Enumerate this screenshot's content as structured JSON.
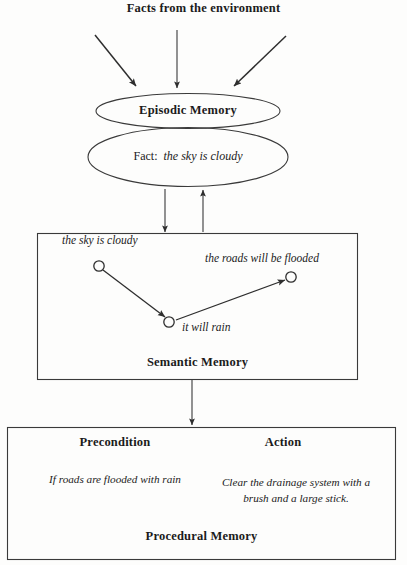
{
  "diagram": {
    "headline": "Facts from the environment",
    "episodic": {
      "title": "Episodic Memory",
      "fact_lead": "Fact:",
      "fact_value": "the sky is cloudy"
    },
    "semantic": {
      "title": "Semantic Memory",
      "nodes": [
        {
          "id": "a",
          "label": "the sky is cloudy"
        },
        {
          "id": "b",
          "label": "it will rain"
        },
        {
          "id": "c",
          "label": "the roads will be flooded"
        }
      ]
    },
    "procedural": {
      "title": "Procedural Memory",
      "precondition_header": "Precondition",
      "action_header": "Action",
      "precondition_text": "If roads are flooded with rain",
      "action_text": "Clear the drainage system with a brush and  a large stick."
    },
    "colors": {
      "ink": "#1b1b1b",
      "stroke": "#3a3a3a",
      "background": "#fdfdfc"
    }
  }
}
